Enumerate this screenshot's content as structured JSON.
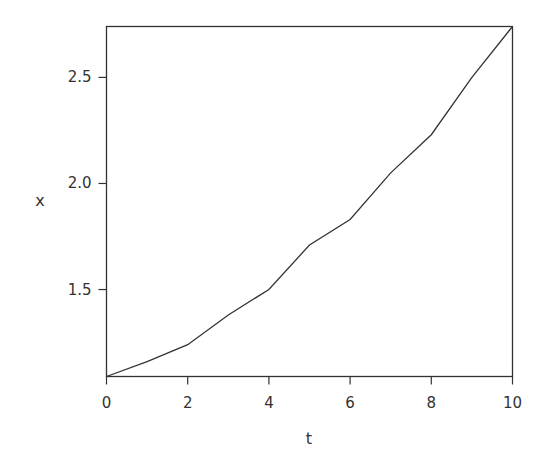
{
  "chart_data": {
    "type": "line",
    "title": "",
    "xlabel": "t",
    "ylabel": "x",
    "x": [
      0,
      1,
      2,
      3,
      4,
      5,
      6,
      7,
      8,
      9,
      10
    ],
    "series": [
      {
        "name": "x",
        "values": [
          1.09,
          1.16,
          1.24,
          1.38,
          1.5,
          1.71,
          1.83,
          2.05,
          2.23,
          2.5,
          2.74
        ]
      }
    ],
    "xlim": [
      0,
      10
    ],
    "ylim": [
      1.09,
      2.74
    ],
    "xticks": [
      0,
      2,
      4,
      6,
      8,
      10
    ],
    "xtick_labels": [
      "0",
      "2",
      "4",
      "6",
      "8",
      "10"
    ],
    "yticks": [
      1.5,
      2.0,
      2.5
    ],
    "ytick_labels": [
      "1.5",
      "2.0",
      "2.5"
    ],
    "grid": false,
    "legend": null,
    "line_color": "#333333"
  }
}
